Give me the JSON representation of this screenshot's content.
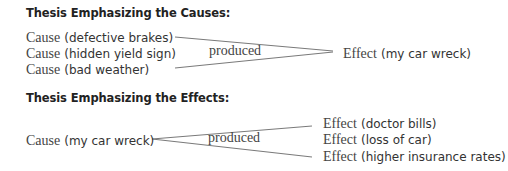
{
  "section_causes": {
    "title": "Thesis Emphasizing the Causes:",
    "causes": [
      {
        "prefix": "Cause",
        "detail": "(defective brakes)"
      },
      {
        "prefix": "Cause",
        "detail": "(hidden yield sign)"
      },
      {
        "prefix": "Cause",
        "detail": "(bad weather)"
      }
    ],
    "connector_label": "produced",
    "effect": {
      "prefix": "Effect",
      "detail": "(my car wreck)"
    }
  },
  "section_effects": {
    "title": "Thesis Emphasizing the Effects:",
    "cause": {
      "prefix": "Cause",
      "detail": "(my car wreck)"
    },
    "connector_label": "produced",
    "effects": [
      {
        "prefix": "Effect",
        "detail": "(doctor bills)"
      },
      {
        "prefix": "Effect",
        "detail": "(loss of car)"
      },
      {
        "prefix": "Effect",
        "detail": "(higher insurance rates)"
      }
    ]
  },
  "colors": {
    "line": "#777777",
    "text": "#333333"
  }
}
